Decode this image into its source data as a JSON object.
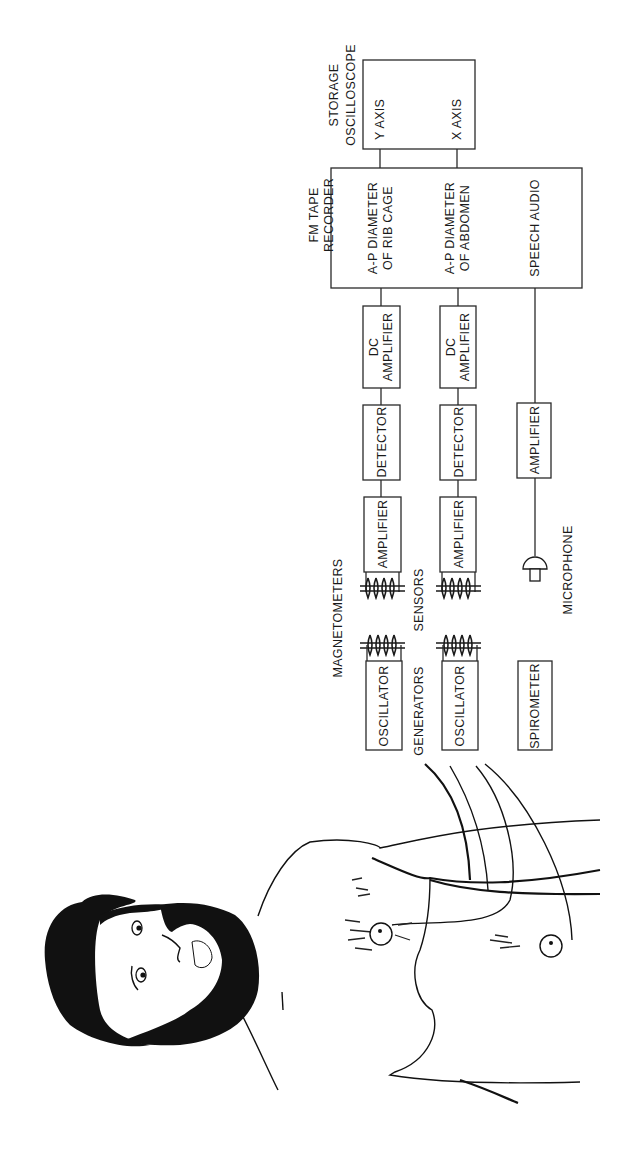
{
  "figure": {
    "orientation": "rotated-90-ccw",
    "subject_illustration": "bearded man, shirtless, with two magnetometer sensor discs on chest and abdomen"
  },
  "blocks": {
    "oscilloscope": {
      "title_line1": "STORAGE",
      "title_line2": "OSCILLOSCOPE",
      "input_y": "Y AXIS",
      "input_x": "X AXIS"
    },
    "recorder": {
      "title_line1": "FM TAPE",
      "title_line2": "RECORDER",
      "channels": [
        {
          "line1": "A-P DIAMETER",
          "line2": "OF RIB CAGE"
        },
        {
          "line1": "A-P DIAMETER",
          "line2": "OF ABDOMEN"
        },
        {
          "line1": "SPEECH AUDIO",
          "line2": ""
        }
      ]
    },
    "dc_amplifiers": [
      {
        "line1": "DC",
        "line2": "AMPLIFIER"
      },
      {
        "line1": "DC",
        "line2": "AMPLIFIER"
      }
    ],
    "detectors": [
      "DETECTOR",
      "DETECTOR"
    ],
    "amplifiers": [
      "AMPLIFIER",
      "AMPLIFIER"
    ],
    "speech_amplifier": "AMPLIFIER",
    "oscillators": [
      "OSCILLATOR",
      "OSCILLATOR"
    ],
    "spirometer": "SPIROMETER"
  },
  "labels": {
    "magnetometers": "MAGNETOMETERS",
    "sensors": "SENSORS",
    "generators": "GENERATORS",
    "microphone": "MICROPHONE"
  },
  "colors": {
    "ink": "#1a1a1a",
    "background": "#ffffff"
  }
}
